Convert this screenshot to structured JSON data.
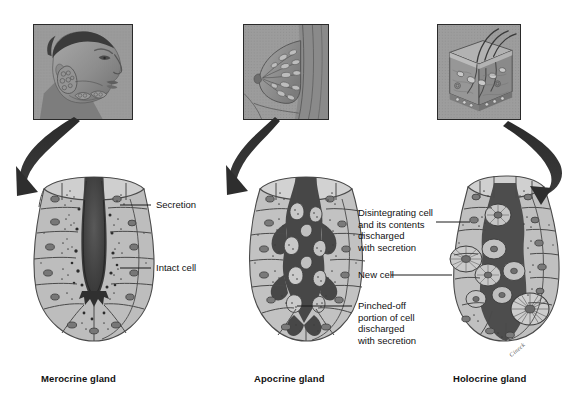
{
  "figure": {
    "background_color": "#ffffff",
    "ink_color": "#111111"
  },
  "columns": [
    {
      "id": "merocrine",
      "caption": "Merocrine gland",
      "photo_name": "head-salivary-gland-photo",
      "photo_description": "Lateral view of human head showing salivary glands",
      "gland_name": "merocrine-gland-diagram"
    },
    {
      "id": "apocrine",
      "caption": "Apocrine gland",
      "photo_name": "breast-mammary-gland-photo",
      "photo_description": "Sagittal section of breast showing mammary gland",
      "gland_name": "apocrine-gland-diagram"
    },
    {
      "id": "holocrine",
      "caption": "Holocrine gland",
      "photo_name": "skin-sebaceous-gland-photo",
      "photo_description": "Block of skin showing hair follicles and sebaceous glands",
      "gland_name": "holocrine-gland-diagram"
    }
  ],
  "callouts": [
    {
      "id": "secretion",
      "text": "Secretion",
      "column": "merocrine"
    },
    {
      "id": "intact-cell",
      "text": "Intact cell",
      "column": "merocrine"
    },
    {
      "id": "disintegrating-cell",
      "text": "Disintegrating cell\nand its contents\ndischarged\nwith secretion",
      "column": "holocrine"
    },
    {
      "id": "new-cell",
      "text": "New cell",
      "column": "holocrine"
    },
    {
      "id": "pinched-off-portion",
      "text": "Pinched-off\nportion of cell\ndischarged\nwith secretion",
      "column": "apocrine"
    }
  ],
  "artist_signature": "Cineck"
}
